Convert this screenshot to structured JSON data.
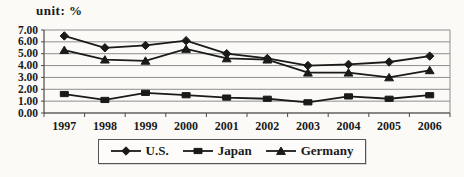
{
  "chart_data": {
    "type": "line",
    "title": "",
    "unit_label": "unit: %",
    "categories": [
      "1997",
      "1998",
      "1999",
      "2000",
      "2001",
      "2002",
      "2003",
      "2004",
      "2005",
      "2006"
    ],
    "series": [
      {
        "name": "U.S.",
        "marker": "diamond",
        "values": [
          6.5,
          5.5,
          5.7,
          6.1,
          5.0,
          4.6,
          4.0,
          4.1,
          4.3,
          4.8
        ]
      },
      {
        "name": "Japan",
        "marker": "square",
        "values": [
          1.6,
          1.1,
          1.7,
          1.5,
          1.3,
          1.2,
          0.9,
          1.4,
          1.2,
          1.5
        ]
      },
      {
        "name": "Germany",
        "marker": "triangle",
        "values": [
          5.3,
          4.5,
          4.4,
          5.4,
          4.6,
          4.5,
          3.4,
          3.4,
          3.0,
          3.6
        ]
      }
    ],
    "ylim": [
      0,
      7
    ],
    "yticks": [
      "0.00",
      "1.00",
      "2.00",
      "3.00",
      "4.00",
      "5.00",
      "6.00",
      "7.00"
    ],
    "grid": "horizontal",
    "legend_position": "bottom",
    "colors": {
      "series": "#1a1a1a",
      "gridline": "#8d8d8d",
      "axis": "#4a4a4a",
      "text": "#1a1a1a"
    }
  }
}
